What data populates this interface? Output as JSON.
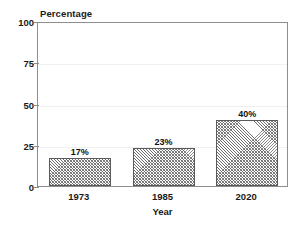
{
  "figure": {
    "title_remnant": "",
    "background_color": "#ffffff",
    "frame_color": "#8e8e8e",
    "bar_edge_color": "#5a5a5a",
    "bar_hatch_color": "#6e6e6e"
  },
  "chart_data": {
    "type": "bar",
    "title": "",
    "xlabel": "Year",
    "ylabel": "Percentage",
    "categories": [
      "1973",
      "1985",
      "2020"
    ],
    "values": [
      17,
      23,
      40
    ],
    "value_labels": [
      "17%",
      "23%",
      "40%"
    ],
    "ylim": [
      0,
      100
    ],
    "yticks": [
      0,
      25,
      50,
      75,
      100
    ],
    "ytick_labels": [
      "0",
      "25",
      "50",
      "75",
      "100"
    ],
    "grid": true,
    "legend": "none",
    "orientation": "vertical",
    "bar_hatch": "cross-hatch"
  }
}
